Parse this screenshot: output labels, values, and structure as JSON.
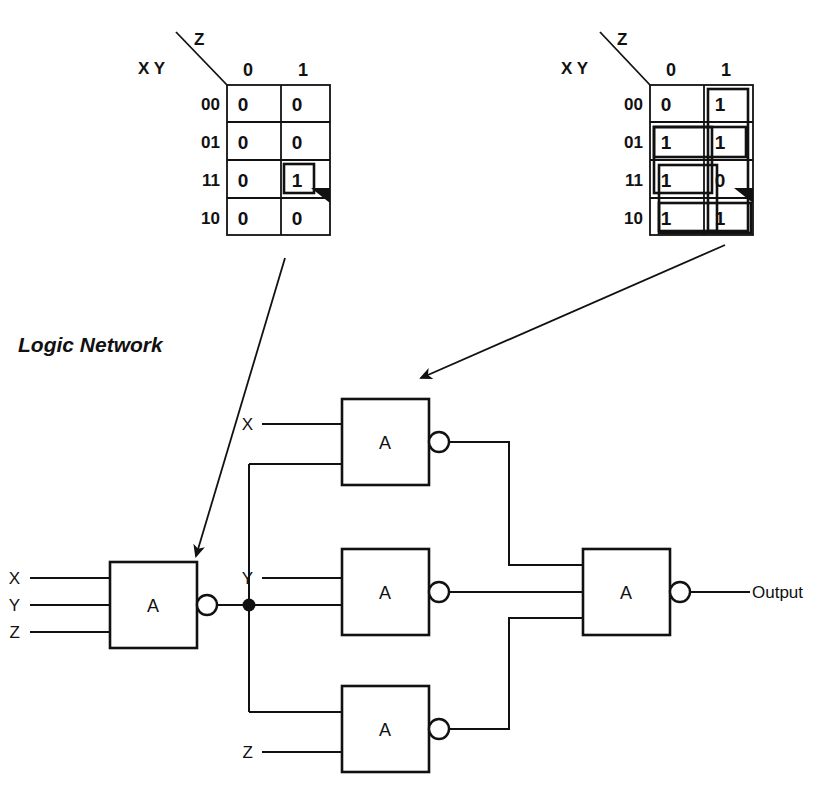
{
  "section": {
    "logic_network_title": "Logic Network"
  },
  "kmaps": [
    {
      "id": "kmap-left",
      "diag_var": "Z",
      "row_var": "X Y",
      "col_headers": [
        "0",
        "1"
      ],
      "row_labels": [
        "00",
        "01",
        "11",
        "10"
      ],
      "cells": [
        [
          "0",
          "0"
        ],
        [
          "0",
          "0"
        ],
        [
          "0",
          "1"
        ],
        [
          "0",
          "0"
        ]
      ],
      "groups": [
        {
          "name": "group-xyz",
          "row": 2,
          "col": 1,
          "rows": 1,
          "cols": 1
        }
      ]
    },
    {
      "id": "kmap-right",
      "diag_var": "Z",
      "row_var": "X Y",
      "col_headers": [
        "0",
        "1"
      ],
      "row_labels": [
        "00",
        "01",
        "11",
        "10"
      ],
      "cells": [
        [
          "0",
          "1"
        ],
        [
          "1",
          "1"
        ],
        [
          "1",
          "0"
        ],
        [
          "1",
          "1"
        ]
      ],
      "groups": [
        {
          "name": "group-col-z",
          "row": 0,
          "col": 1,
          "rows": 4,
          "cols": 1
        },
        {
          "name": "group-rows-01-11",
          "row": 1,
          "col": 0,
          "rows": 2,
          "cols": 1
        },
        {
          "name": "group-rows-11-10",
          "row": 2,
          "col": 0,
          "rows": 2,
          "cols": 1
        },
        {
          "name": "group-row-01-wide",
          "row": 1,
          "col": 0,
          "rows": 1,
          "cols": 2
        },
        {
          "name": "group-row-10-wide",
          "row": 3,
          "col": 0,
          "rows": 1,
          "cols": 2
        }
      ]
    }
  ],
  "logic": {
    "gate_label": "A",
    "gates": [
      {
        "name": "gate-nand-1",
        "label": "A",
        "inputs": [
          "X",
          "Y",
          "Z"
        ]
      },
      {
        "name": "gate-nand-2",
        "label": "A",
        "inputs": [
          "X",
          ""
        ]
      },
      {
        "name": "gate-nand-3",
        "label": "A",
        "inputs": [
          "Y",
          ""
        ]
      },
      {
        "name": "gate-nand-4",
        "label": "A",
        "inputs": [
          "",
          "Z"
        ]
      },
      {
        "name": "gate-nand-out",
        "label": "A",
        "inputs": [
          "",
          "",
          ""
        ]
      }
    ],
    "input_labels": [
      "X",
      "Y",
      "Z"
    ],
    "gate2_input": "X",
    "gate3_input": "Y",
    "gate4_input": "Z",
    "output_label": "Output"
  },
  "colors": {
    "ink": "#111111",
    "paper": "#ffffff"
  }
}
